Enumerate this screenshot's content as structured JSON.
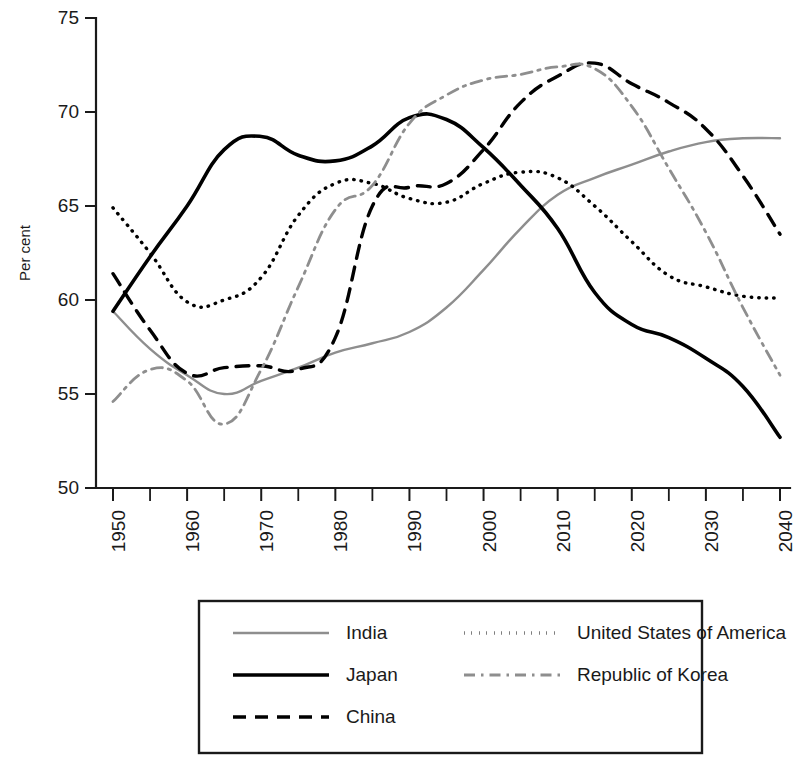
{
  "chart_data": {
    "type": "line",
    "title": "",
    "xlabel": "",
    "ylabel": "Per cent",
    "xlim": [
      1950,
      2040
    ],
    "ylim": [
      50,
      75
    ],
    "grid": false,
    "legend_position": "below",
    "x_major_ticks": [
      1950,
      1960,
      1970,
      1980,
      1990,
      2000,
      2010,
      2020,
      2030,
      2040
    ],
    "x_tick_labels": [
      "1950",
      "1960",
      "1970",
      "1980",
      "1990",
      "2000",
      "2010",
      "2020",
      "2030",
      "2040"
    ],
    "x_minor_tick_step": 5,
    "y_ticks": [
      50,
      55,
      60,
      65,
      70,
      75
    ],
    "y_tick_labels": [
      "50",
      "55",
      "60",
      "65",
      "70",
      "75"
    ],
    "x": [
      1950,
      1955,
      1960,
      1965,
      1970,
      1975,
      1980,
      1985,
      1990,
      1995,
      2000,
      2005,
      2010,
      2015,
      2020,
      2025,
      2030,
      2035,
      2040
    ],
    "series": [
      {
        "name": "India",
        "style": "solid-thin",
        "color": "#8e8e8e",
        "values": [
          59.4,
          57.4,
          56.0,
          55.0,
          55.7,
          56.4,
          57.2,
          57.7,
          58.3,
          59.6,
          61.6,
          63.8,
          65.6,
          66.5,
          67.2,
          67.9,
          68.4,
          68.6,
          68.6
        ]
      },
      {
        "name": "Japan",
        "style": "solid-thick",
        "color": "#000000",
        "values": [
          59.4,
          62.3,
          65.0,
          68.0,
          68.7,
          67.7,
          67.4,
          68.2,
          69.7,
          69.6,
          68.1,
          66.1,
          63.8,
          60.4,
          58.7,
          58.0,
          56.9,
          55.4,
          52.7
        ]
      },
      {
        "name": "China",
        "style": "dashed",
        "color": "#000000",
        "values": [
          61.4,
          58.4,
          56.1,
          56.4,
          56.5,
          56.3,
          58.0,
          65.0,
          66.0,
          66.2,
          68.0,
          70.5,
          71.9,
          72.6,
          71.5,
          70.5,
          69.1,
          66.6,
          63.5
        ]
      },
      {
        "name": "United States of America",
        "style": "dotted",
        "color": "#000000",
        "values": [
          64.9,
          62.5,
          59.9,
          60.0,
          61.2,
          64.5,
          66.2,
          66.2,
          65.4,
          65.2,
          66.2,
          66.8,
          66.5,
          65.0,
          63.1,
          61.3,
          60.7,
          60.2,
          60.1
        ]
      },
      {
        "name": "Republic of Korea",
        "style": "dash-dot",
        "color": "#8e8e8e",
        "values": [
          54.6,
          56.3,
          55.7,
          53.4,
          56.3,
          60.7,
          64.8,
          66.1,
          69.4,
          70.9,
          71.7,
          72.0,
          72.4,
          72.3,
          70.3,
          67.0,
          63.6,
          59.6,
          56.0
        ]
      }
    ]
  },
  "axis": {
    "y_title": "Per cent"
  },
  "legend": {
    "entries": [
      {
        "label": "India",
        "style": "solid-thin",
        "color": "#8e8e8e"
      },
      {
        "label": "United States of America",
        "style": "dotted",
        "color": "#000000"
      },
      {
        "label": "Japan",
        "style": "solid-thick",
        "color": "#000000"
      },
      {
        "label": "Republic of Korea",
        "style": "dash-dot",
        "color": "#8e8e8e"
      },
      {
        "label": "China",
        "style": "dashed",
        "color": "#000000"
      }
    ]
  },
  "colors": {
    "gray_series": "#8e8e8e",
    "black_series": "#000000",
    "axis": "#1a1a1a",
    "background": "#ffffff"
  }
}
